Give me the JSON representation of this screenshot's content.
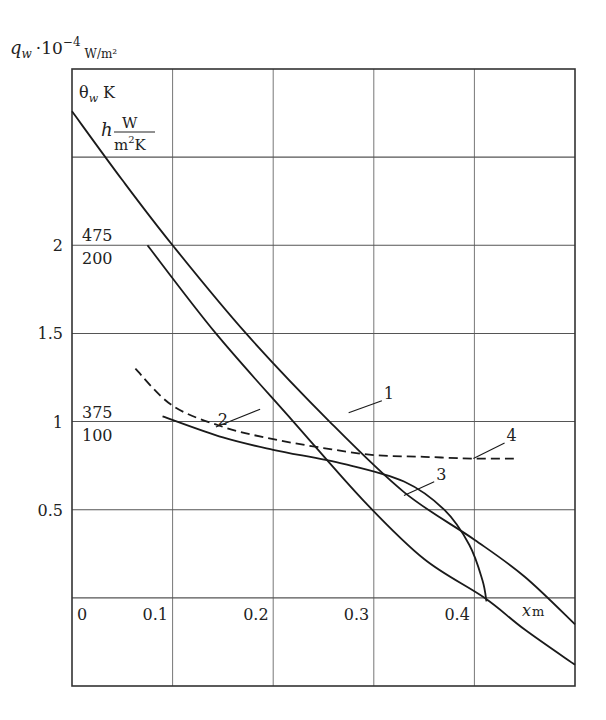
{
  "chart_data": {
    "type": "line",
    "title": "",
    "ylabel_main": {
      "symbol": "q",
      "sub": "w",
      "factor": "·10",
      "exp": "−4",
      "unit": "W/m²"
    },
    "ylabel_secondary": {
      "symbol": "θ",
      "sub": "w",
      "unit": "K"
    },
    "ylabel_third": {
      "symbol": "h",
      "unit_num": "W",
      "unit_den_base": "m",
      "unit_den_exp": "2",
      "unit_den_tail": "K"
    },
    "xlabel": {
      "symbol": "x",
      "unit": "m"
    },
    "xlim": [
      0,
      0.5
    ],
    "ylim": [
      -0.5,
      3.0
    ],
    "grid": true,
    "x_ticks": [
      {
        "value": 0,
        "label": "0"
      },
      {
        "value": 0.1,
        "label": "0.1"
      },
      {
        "value": 0.2,
        "label": "0.2"
      },
      {
        "value": 0.3,
        "label": "0.3"
      },
      {
        "value": 0.4,
        "label": "0.4"
      }
    ],
    "y_ticks": [
      {
        "value": 0.5,
        "label": "0.5"
      },
      {
        "value": 1,
        "label": "1"
      },
      {
        "value": 1.5,
        "label": "1.5"
      },
      {
        "value": 2,
        "label": "2"
      }
    ],
    "y_secondary_ticks": [
      {
        "value": 2,
        "theta": "475",
        "h": "200"
      },
      {
        "value": 1,
        "theta": "375",
        "h": "100"
      }
    ],
    "series": [
      {
        "name": "1",
        "style": "solid",
        "x": [
          0,
          0.05,
          0.1,
          0.173,
          0.256,
          0.33,
          0.4,
          0.45,
          0.5
        ],
        "y": [
          2.76,
          2.37,
          2.0,
          1.5,
          1.0,
          0.6,
          0.33,
          0.12,
          -0.15
        ],
        "label_pos": [
          0.31,
          1.13
        ],
        "leader_to": [
          0.275,
          1.05
        ]
      },
      {
        "name": "2",
        "style": "solid",
        "x": [
          0.075,
          0.143,
          0.22,
          0.29,
          0.35,
          0.41,
          0.45,
          0.5
        ],
        "y": [
          2.0,
          1.5,
          1.0,
          0.55,
          0.22,
          0.0,
          -0.18,
          -0.38
        ],
        "label_pos": [
          0.145,
          0.98
        ],
        "leader_to": [
          0.187,
          1.07
        ]
      },
      {
        "name": "3",
        "style": "solid",
        "x": [
          0.09,
          0.15,
          0.2,
          0.27,
          0.33,
          0.37,
          0.395,
          0.408,
          0.412
        ],
        "y": [
          1.03,
          0.91,
          0.84,
          0.76,
          0.66,
          0.5,
          0.3,
          0.1,
          -0.02
        ],
        "label_pos": [
          0.362,
          0.67
        ],
        "leader_to": [
          0.33,
          0.58
        ]
      },
      {
        "name": "4",
        "style": "dashed",
        "x": [
          0.063,
          0.1,
          0.15,
          0.2,
          0.25,
          0.3,
          0.35,
          0.4,
          0.44
        ],
        "y": [
          1.3,
          1.09,
          0.97,
          0.9,
          0.85,
          0.81,
          0.8,
          0.79,
          0.79
        ],
        "label_pos": [
          0.432,
          0.89
        ],
        "leader_to": [
          0.399,
          0.79
        ]
      }
    ]
  }
}
